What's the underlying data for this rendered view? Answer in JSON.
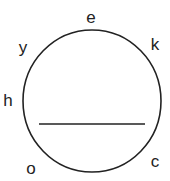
{
  "diagram": {
    "circle": {
      "cx": 92,
      "cy": 101,
      "rx": 69,
      "ry": 71,
      "stroke": "#222222"
    },
    "chord": {
      "x1": 39,
      "y1": 124,
      "x2": 145,
      "y2": 124,
      "stroke": "#222222"
    },
    "labels": [
      {
        "id": "e",
        "text": "e",
        "x": 91,
        "y": 23
      },
      {
        "id": "k",
        "text": "k",
        "x": 155,
        "y": 50
      },
      {
        "id": "y",
        "text": "y",
        "x": 23,
        "y": 53
      },
      {
        "id": "h",
        "text": "h",
        "x": 8,
        "y": 106
      },
      {
        "id": "o",
        "text": "o",
        "x": 31,
        "y": 174
      },
      {
        "id": "c",
        "text": "c",
        "x": 155,
        "y": 167
      }
    ]
  }
}
